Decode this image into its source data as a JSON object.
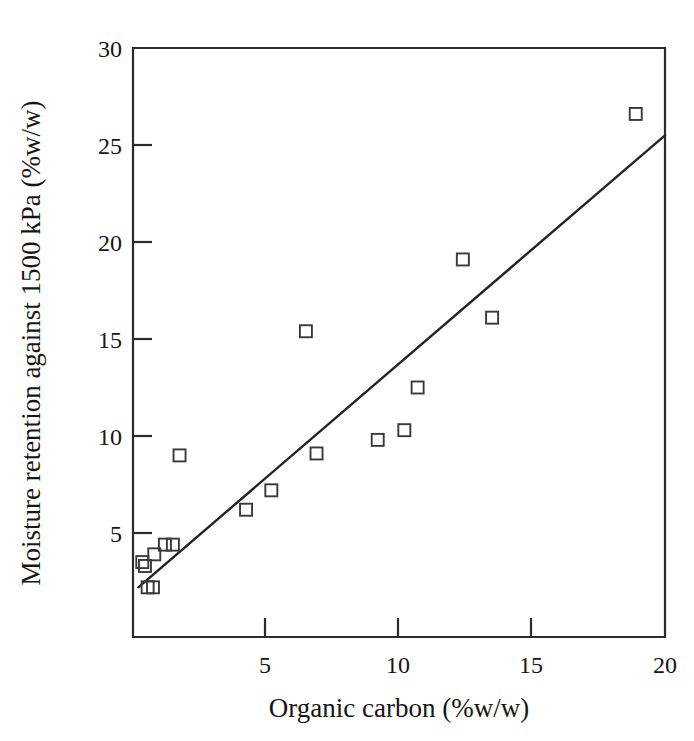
{
  "chart_data": {
    "type": "scatter",
    "title": "",
    "xlabel": "Organic carbon (%w/w)",
    "ylabel": "Moisture retention against 1500 kPa (%w/w)",
    "xlim": [
      0,
      20
    ],
    "ylim": [
      0,
      30
    ],
    "xticks": [
      5,
      10,
      15,
      20
    ],
    "yticks": [
      5,
      10,
      15,
      20,
      25,
      30
    ],
    "xtick_labels": [
      "5",
      "10",
      "15",
      "20"
    ],
    "ytick_labels": [
      "5",
      "10",
      "15",
      "20",
      "25",
      "30"
    ],
    "grid": false,
    "legend": null,
    "marker_style": "open-square",
    "points": [
      {
        "x": 0.35,
        "y": 3.5
      },
      {
        "x": 0.45,
        "y": 3.3
      },
      {
        "x": 0.55,
        "y": 2.2
      },
      {
        "x": 0.75,
        "y": 2.2
      },
      {
        "x": 0.8,
        "y": 3.9
      },
      {
        "x": 1.2,
        "y": 4.4
      },
      {
        "x": 1.5,
        "y": 4.4
      },
      {
        "x": 1.75,
        "y": 9.0
      },
      {
        "x": 4.25,
        "y": 6.2
      },
      {
        "x": 5.2,
        "y": 7.2
      },
      {
        "x": 6.5,
        "y": 15.4
      },
      {
        "x": 6.9,
        "y": 9.1
      },
      {
        "x": 9.2,
        "y": 9.8
      },
      {
        "x": 10.2,
        "y": 10.3
      },
      {
        "x": 10.7,
        "y": 12.5
      },
      {
        "x": 12.4,
        "y": 19.1
      },
      {
        "x": 13.5,
        "y": 16.1
      },
      {
        "x": 18.9,
        "y": 26.6
      }
    ],
    "trend_line": {
      "type": "linear-fit",
      "x_start": 0.2,
      "y_start": 2.2,
      "x_end": 20.0,
      "y_end": 25.5
    }
  }
}
